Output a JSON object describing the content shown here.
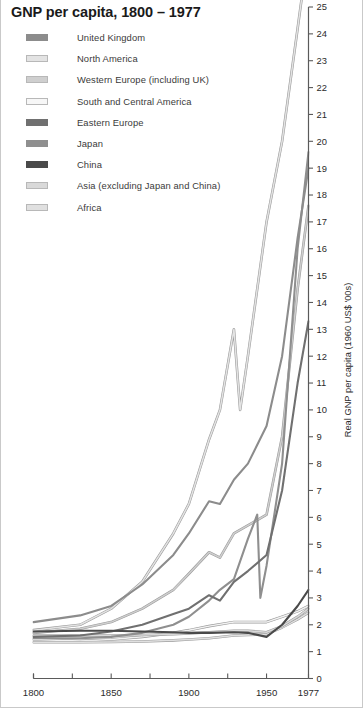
{
  "chart_data": {
    "type": "line",
    "title": "GNP per capita, 1800 – 1977",
    "xlabel": "",
    "ylabel": "Real GNP per capita (1960 US$ '00s)",
    "xlim": [
      1800,
      1977
    ],
    "ylim": [
      0,
      25
    ],
    "grid": false,
    "legend_position": "top-left",
    "y_ticks": [
      0,
      1,
      2,
      3,
      4,
      5,
      6,
      7,
      8,
      9,
      10,
      11,
      12,
      13,
      14,
      15,
      16,
      17,
      18,
      19,
      20,
      21,
      22,
      23,
      24,
      25
    ],
    "x_ticks": [
      1800,
      1825,
      1850,
      1875,
      1900,
      1925,
      1950,
      1977
    ],
    "x_tick_labels": [
      {
        "value": 1800,
        "label": "1800"
      },
      {
        "value": 1850,
        "label": "1850"
      },
      {
        "value": 1900,
        "label": "1900"
      },
      {
        "value": 1950,
        "label": "1950"
      },
      {
        "value": 1977,
        "label": "1977"
      }
    ],
    "series": [
      {
        "name": "United Kingdom",
        "color": "#8c8c8c",
        "points": [
          [
            1800,
            2.1
          ],
          [
            1830,
            2.35
          ],
          [
            1850,
            2.7
          ],
          [
            1870,
            3.5
          ],
          [
            1890,
            4.6
          ],
          [
            1900,
            5.4
          ],
          [
            1913,
            6.6
          ],
          [
            1920,
            6.5
          ],
          [
            1929,
            7.4
          ],
          [
            1938,
            8.0
          ],
          [
            1950,
            9.4
          ],
          [
            1960,
            12.0
          ],
          [
            1970,
            16.4
          ],
          [
            1977,
            19.0
          ]
        ]
      },
      {
        "name": "North America",
        "color": "#e3e3e3",
        "points": [
          [
            1800,
            1.8
          ],
          [
            1830,
            2.0
          ],
          [
            1850,
            2.6
          ],
          [
            1870,
            3.6
          ],
          [
            1890,
            5.4
          ],
          [
            1900,
            6.5
          ],
          [
            1913,
            8.9
          ],
          [
            1920,
            10.0
          ],
          [
            1929,
            13.0
          ],
          [
            1933,
            10.0
          ],
          [
            1938,
            12.0
          ],
          [
            1950,
            17.0
          ],
          [
            1960,
            20.0
          ],
          [
            1970,
            24.2
          ],
          [
            1977,
            27.2
          ]
        ]
      },
      {
        "name": "Western Europe (including UK)",
        "color": "#cfcfcf",
        "points": [
          [
            1800,
            1.7
          ],
          [
            1830,
            1.85
          ],
          [
            1850,
            2.1
          ],
          [
            1870,
            2.6
          ],
          [
            1890,
            3.3
          ],
          [
            1900,
            3.9
          ],
          [
            1913,
            4.7
          ],
          [
            1920,
            4.5
          ],
          [
            1929,
            5.4
          ],
          [
            1938,
            5.7
          ],
          [
            1950,
            6.1
          ],
          [
            1960,
            9.0
          ],
          [
            1970,
            14.5
          ],
          [
            1977,
            17.6
          ]
        ]
      },
      {
        "name": "South and Central America",
        "color": "#f2f2f2",
        "points": [
          [
            1800,
            1.45
          ],
          [
            1830,
            1.4
          ],
          [
            1850,
            1.45
          ],
          [
            1870,
            1.55
          ],
          [
            1890,
            1.7
          ],
          [
            1900,
            1.8
          ],
          [
            1913,
            1.95
          ],
          [
            1929,
            2.1
          ],
          [
            1938,
            2.1
          ],
          [
            1950,
            2.1
          ],
          [
            1960,
            2.3
          ],
          [
            1970,
            2.5
          ],
          [
            1977,
            2.7
          ]
        ]
      },
      {
        "name": "Eastern Europe",
        "color": "#707070",
        "points": [
          [
            1800,
            1.55
          ],
          [
            1830,
            1.6
          ],
          [
            1850,
            1.75
          ],
          [
            1870,
            2.0
          ],
          [
            1890,
            2.4
          ],
          [
            1900,
            2.6
          ],
          [
            1913,
            3.1
          ],
          [
            1920,
            2.9
          ],
          [
            1929,
            3.6
          ],
          [
            1938,
            4.0
          ],
          [
            1950,
            4.6
          ],
          [
            1960,
            7.0
          ],
          [
            1970,
            11.0
          ],
          [
            1977,
            13.3
          ]
        ]
      },
      {
        "name": "Japan",
        "color": "#8f8f8f",
        "points": [
          [
            1800,
            1.5
          ],
          [
            1830,
            1.5
          ],
          [
            1850,
            1.55
          ],
          [
            1870,
            1.7
          ],
          [
            1890,
            2.0
          ],
          [
            1900,
            2.3
          ],
          [
            1913,
            2.9
          ],
          [
            1920,
            3.3
          ],
          [
            1929,
            3.7
          ],
          [
            1938,
            5.2
          ],
          [
            1944,
            6.1
          ],
          [
            1946,
            3.0
          ],
          [
            1950,
            4.2
          ],
          [
            1960,
            8.0
          ],
          [
            1970,
            16.0
          ],
          [
            1977,
            19.6
          ]
        ]
      },
      {
        "name": "China",
        "color": "#4a4a4a",
        "points": [
          [
            1800,
            1.75
          ],
          [
            1830,
            1.78
          ],
          [
            1850,
            1.78
          ],
          [
            1870,
            1.75
          ],
          [
            1890,
            1.72
          ],
          [
            1900,
            1.7
          ],
          [
            1913,
            1.7
          ],
          [
            1929,
            1.72
          ],
          [
            1938,
            1.7
          ],
          [
            1950,
            1.55
          ],
          [
            1960,
            2.0
          ],
          [
            1970,
            2.7
          ],
          [
            1977,
            3.3
          ]
        ]
      },
      {
        "name": "Asia (excluding Japan and China)",
        "color": "#d9d9d9",
        "points": [
          [
            1800,
            1.6
          ],
          [
            1830,
            1.6
          ],
          [
            1850,
            1.6
          ],
          [
            1870,
            1.62
          ],
          [
            1890,
            1.65
          ],
          [
            1900,
            1.68
          ],
          [
            1913,
            1.72
          ],
          [
            1929,
            1.78
          ],
          [
            1938,
            1.78
          ],
          [
            1950,
            1.72
          ],
          [
            1960,
            1.95
          ],
          [
            1970,
            2.3
          ],
          [
            1977,
            2.6
          ]
        ]
      },
      {
        "name": "Africa",
        "color": "#e0e0e0",
        "points": [
          [
            1800,
            1.35
          ],
          [
            1830,
            1.35
          ],
          [
            1850,
            1.36
          ],
          [
            1870,
            1.38
          ],
          [
            1890,
            1.42
          ],
          [
            1900,
            1.45
          ],
          [
            1913,
            1.5
          ],
          [
            1929,
            1.6
          ],
          [
            1938,
            1.62
          ],
          [
            1950,
            1.65
          ],
          [
            1960,
            1.9
          ],
          [
            1970,
            2.2
          ],
          [
            1977,
            2.45
          ]
        ]
      }
    ]
  },
  "legend": {
    "items": [
      {
        "label": "United Kingdom",
        "color": "#8c8c8c"
      },
      {
        "label": "North America",
        "color": "#e3e3e3"
      },
      {
        "label": "Western Europe (including UK)",
        "color": "#cfcfcf"
      },
      {
        "label": "South and Central America",
        "color": "#f7f7f7"
      },
      {
        "label": "Eastern Europe",
        "color": "#707070"
      },
      {
        "label": "Japan",
        "color": "#8f8f8f"
      },
      {
        "label": "China",
        "color": "#4a4a4a"
      },
      {
        "label": "Asia (excluding Japan and China)",
        "color": "#d9d9d9"
      },
      {
        "label": "Africa",
        "color": "#e0e0e0"
      }
    ]
  },
  "axes": {
    "y_title": "Real GNP per capita (1960 US$ '00s)",
    "y_tick_labels": [
      "0",
      "1",
      "2",
      "3",
      "4",
      "5",
      "6",
      "7",
      "8",
      "9",
      "10",
      "11",
      "12",
      "13",
      "14",
      "15",
      "16",
      "17",
      "18",
      "19",
      "20",
      "21",
      "22",
      "23",
      "24",
      "25"
    ],
    "x_tick_labels": [
      "1800",
      "1850",
      "1900",
      "1950",
      "1977"
    ]
  },
  "colors": {
    "axis": "#5a5a5a",
    "text": "#2b2b2b",
    "background": "#ffffff",
    "frame": "#c9c9c9"
  }
}
